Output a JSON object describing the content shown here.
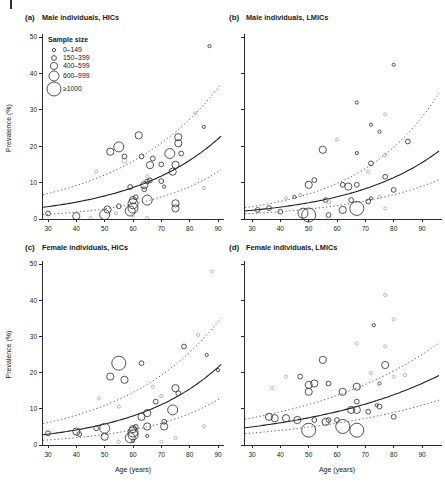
{
  "figure": {
    "type": "four-panel-bubble-scatter",
    "x_axis_label": "Age (years)",
    "y_axis_label": "Prevalence (%)"
  },
  "legend": {
    "title": "Sample size",
    "items": [
      {
        "label": "0–149",
        "size_class": 1
      },
      {
        "label": "150–399",
        "size_class": 2
      },
      {
        "label": "400–599",
        "size_class": 3
      },
      {
        "label": "600–999",
        "size_class": 4
      },
      {
        "label": "≥1000",
        "size_class": 5
      }
    ]
  },
  "style": {
    "point_color": "#3f3f3f",
    "point_color_light": "#b0b0b0",
    "curve_color": "#1e1e1e",
    "ci_color": "#4a4a4a",
    "axis_color": "#2b2b2b",
    "text_color": "#1a1a1a"
  },
  "chart_data": [
    {
      "panel": "a",
      "label": "(a)",
      "title": "Male individuals, HICs",
      "type": "scatter",
      "row": "top",
      "col": "left",
      "xlabel": "Age (years)",
      "ylabel": "Prevalence (%)",
      "xticks": [
        30,
        40,
        50,
        60,
        70,
        80,
        90
      ],
      "yticks": [
        0,
        10,
        20,
        30,
        40,
        50
      ],
      "xlim": [
        28,
        92
      ],
      "ylim": [
        0,
        50
      ],
      "show_legend": true,
      "show_x_title": false,
      "show_y_labels": true,
      "fit_solid": {
        "start": 3.4,
        "end": 22.0
      },
      "fit_upper": {
        "start": 7.0,
        "end": 36.0
      },
      "fit_lower": {
        "start": 1.3,
        "end": 13.0
      },
      "points": [
        [
          30,
          1.5,
          2,
          0
        ],
        [
          40,
          0.8,
          3,
          0
        ],
        [
          45,
          0.3,
          1,
          1
        ],
        [
          50,
          1.2,
          4,
          0
        ],
        [
          51,
          2.6,
          3,
          0
        ],
        [
          54,
          1.6,
          1,
          1
        ],
        [
          55,
          3.5,
          2,
          0
        ],
        [
          47,
          13.0,
          1,
          1
        ],
        [
          52,
          18.5,
          3,
          0
        ],
        [
          55,
          19.8,
          4,
          0
        ],
        [
          57,
          16.0,
          2,
          1
        ],
        [
          57,
          17.2,
          2,
          0
        ],
        [
          59,
          8.8,
          2,
          0
        ],
        [
          59,
          2.2,
          4,
          0
        ],
        [
          60,
          3.0,
          4,
          0
        ],
        [
          60,
          4.2,
          4,
          0
        ],
        [
          60,
          5.2,
          3,
          0
        ],
        [
          61,
          6.0,
          2,
          0
        ],
        [
          60,
          1.0,
          1,
          1
        ],
        [
          62,
          23.0,
          3,
          0
        ],
        [
          63,
          17.2,
          2,
          0
        ],
        [
          64,
          9.3,
          3,
          0
        ],
        [
          64,
          8.2,
          2,
          0
        ],
        [
          65,
          10.3,
          2,
          0
        ],
        [
          66,
          10.6,
          2,
          0
        ],
        [
          65,
          11.7,
          1,
          1
        ],
        [
          65,
          0.3,
          1,
          1
        ],
        [
          65,
          5.2,
          4,
          0
        ],
        [
          66,
          14.8,
          3,
          0
        ],
        [
          67,
          16.6,
          2,
          0
        ],
        [
          70,
          10.4,
          2,
          0
        ],
        [
          71,
          8.9,
          1,
          0
        ],
        [
          70,
          15.0,
          2,
          0
        ],
        [
          73,
          18.0,
          4,
          0
        ],
        [
          75,
          14.9,
          3,
          0
        ],
        [
          74,
          13.0,
          3,
          0
        ],
        [
          76,
          22.5,
          3,
          0
        ],
        [
          76,
          20.8,
          3,
          0
        ],
        [
          75,
          4.3,
          3,
          0
        ],
        [
          75,
          2.9,
          3,
          0
        ],
        [
          77,
          18.0,
          2,
          0
        ],
        [
          82,
          29.0,
          1,
          1
        ],
        [
          85,
          25.3,
          1,
          0
        ],
        [
          85,
          8.5,
          1,
          1
        ],
        [
          87,
          47.5,
          1,
          0
        ]
      ]
    },
    {
      "panel": "b",
      "label": "(b)",
      "title": "Male individuals, LMICs",
      "type": "scatter",
      "row": "top",
      "col": "right",
      "xlabel": "Age (years)",
      "ylabel": "Prevalence (%)",
      "xticks": [
        30,
        40,
        50,
        60,
        70,
        80,
        90
      ],
      "yticks": [
        0,
        10,
        20,
        30,
        40,
        50
      ],
      "xlim": [
        28,
        92
      ],
      "ylim": [
        0,
        50
      ],
      "show_legend": false,
      "show_x_title": false,
      "show_y_labels": false,
      "fit_solid": {
        "start": 2.4,
        "end": 15.5
      },
      "fit_upper": {
        "start": 3.4,
        "end": 28.0
      },
      "fit_lower": {
        "start": 1.5,
        "end": 9.0
      },
      "points": [
        [
          32,
          2.5,
          2,
          0
        ],
        [
          36,
          3.0,
          2,
          0
        ],
        [
          40,
          2.0,
          2,
          0
        ],
        [
          42,
          5.7,
          1,
          1
        ],
        [
          45,
          6.1,
          1,
          0
        ],
        [
          47,
          6.6,
          1,
          1
        ],
        [
          48,
          1.6,
          4,
          0
        ],
        [
          50,
          1.1,
          5,
          0
        ],
        [
          50,
          9.4,
          3,
          0
        ],
        [
          52,
          10.7,
          2,
          0
        ],
        [
          55,
          19.0,
          3,
          0
        ],
        [
          56,
          5.2,
          2,
          0
        ],
        [
          57,
          4.8,
          2,
          1
        ],
        [
          57,
          1.1,
          2,
          0
        ],
        [
          60,
          21.8,
          1,
          1
        ],
        [
          62,
          9.4,
          2,
          0
        ],
        [
          62,
          2.5,
          3,
          0
        ],
        [
          64,
          8.9,
          3,
          0
        ],
        [
          65,
          5.2,
          2,
          0
        ],
        [
          67,
          18.1,
          1,
          0
        ],
        [
          67,
          9.4,
          2,
          0
        ],
        [
          67,
          2.9,
          5,
          0
        ],
        [
          67,
          32.0,
          1,
          0
        ],
        [
          71,
          13.0,
          1,
          1
        ],
        [
          72,
          25.9,
          1,
          0
        ],
        [
          72,
          15.3,
          2,
          0
        ],
        [
          71,
          4.8,
          2,
          0
        ],
        [
          72,
          5.7,
          1,
          0
        ],
        [
          75,
          24.0,
          1,
          0
        ],
        [
          75,
          6.1,
          1,
          1
        ],
        [
          77,
          28.7,
          1,
          1
        ],
        [
          77,
          17.6,
          1,
          1
        ],
        [
          77,
          11.6,
          2,
          0
        ],
        [
          77,
          2.9,
          1,
          1
        ],
        [
          80,
          42.4,
          1,
          0
        ],
        [
          80,
          8.0,
          2,
          0
        ],
        [
          85,
          21.3,
          2,
          0
        ]
      ]
    },
    {
      "panel": "c",
      "label": "(c)",
      "title": "Female individuals, HICs",
      "type": "scatter",
      "row": "bottom",
      "col": "left",
      "xlabel": "Age (years)",
      "ylabel": "Prevalence (%)",
      "xticks": [
        30,
        40,
        50,
        60,
        70,
        80,
        90
      ],
      "yticks": [
        0,
        10,
        20,
        30,
        40,
        50
      ],
      "xlim": [
        28,
        92
      ],
      "ylim": [
        0,
        50
      ],
      "show_legend": false,
      "show_x_title": true,
      "show_y_labels": true,
      "fit_solid": {
        "start": 3.0,
        "end": 21.5
      },
      "fit_upper": {
        "start": 6.2,
        "end": 34.0
      },
      "fit_lower": {
        "start": 1.4,
        "end": 12.5
      },
      "points": [
        [
          30,
          3.2,
          2,
          0
        ],
        [
          40,
          3.7,
          3,
          0
        ],
        [
          41,
          3.0,
          2,
          0
        ],
        [
          47,
          4.6,
          2,
          0
        ],
        [
          48,
          12.9,
          1,
          1
        ],
        [
          50,
          4.6,
          4,
          0
        ],
        [
          50,
          2.3,
          3,
          0
        ],
        [
          52,
          18.9,
          3,
          0
        ],
        [
          55,
          22.6,
          5,
          0
        ],
        [
          55,
          10.6,
          1,
          1
        ],
        [
          57,
          18.0,
          3,
          0
        ],
        [
          55,
          0.9,
          1,
          1
        ],
        [
          59,
          2.0,
          4,
          0
        ],
        [
          60,
          2.8,
          4,
          0
        ],
        [
          60,
          3.6,
          4,
          0
        ],
        [
          60,
          4.4,
          3,
          0
        ],
        [
          60,
          1.2,
          1,
          0
        ],
        [
          61,
          5.0,
          2,
          0
        ],
        [
          63,
          22.6,
          2,
          0
        ],
        [
          63,
          7.8,
          3,
          0
        ],
        [
          65,
          5.1,
          3,
          0
        ],
        [
          65,
          2.5,
          1,
          0
        ],
        [
          65,
          8.8,
          3,
          0
        ],
        [
          67,
          16.1,
          1,
          1
        ],
        [
          68,
          12.0,
          2,
          0
        ],
        [
          70,
          13.5,
          1,
          1
        ],
        [
          71,
          6.4,
          2,
          0
        ],
        [
          71,
          5.1,
          3,
          0
        ],
        [
          70,
          0.9,
          1,
          1
        ],
        [
          74,
          9.7,
          4,
          0
        ],
        [
          75,
          15.7,
          3,
          0
        ],
        [
          76,
          14.3,
          2,
          0
        ],
        [
          75,
          1.9,
          1,
          1
        ],
        [
          78,
          27.2,
          2,
          0
        ],
        [
          83,
          30.4,
          1,
          1
        ],
        [
          85,
          5.2,
          1,
          1
        ],
        [
          86,
          24.9,
          1,
          0
        ],
        [
          88,
          47.9,
          1,
          1
        ],
        [
          90,
          20.7,
          1,
          0
        ]
      ]
    },
    {
      "panel": "d",
      "label": "(d)",
      "title": "Female individuals, LMICs",
      "type": "scatter",
      "row": "bottom",
      "col": "right",
      "xlabel": "Age (years)",
      "ylabel": "Prevalence (%)",
      "xticks": [
        30,
        40,
        50,
        60,
        70,
        80,
        90
      ],
      "yticks": [
        0,
        10,
        20,
        30,
        40,
        50
      ],
      "xlim": [
        28,
        92
      ],
      "ylim": [
        0,
        50
      ],
      "show_legend": false,
      "show_x_title": true,
      "show_y_labels": false,
      "fit_solid": {
        "start": 5.0,
        "end": 17.0
      },
      "fit_upper": {
        "start": 7.5,
        "end": 25.0
      },
      "fit_lower": {
        "start": 3.3,
        "end": 11.0
      },
      "points": [
        [
          36,
          7.8,
          3,
          0
        ],
        [
          37,
          15.7,
          1,
          1
        ],
        [
          38,
          7.4,
          3,
          0
        ],
        [
          42,
          7.4,
          3,
          0
        ],
        [
          42,
          18.9,
          1,
          1
        ],
        [
          46,
          6.9,
          3,
          0
        ],
        [
          47,
          18.9,
          2,
          0
        ],
        [
          50,
          16.6,
          3,
          0
        ],
        [
          52,
          17.0,
          3,
          0
        ],
        [
          50,
          14.7,
          3,
          0
        ],
        [
          50,
          4.1,
          5,
          0
        ],
        [
          52,
          6.9,
          2,
          0
        ],
        [
          55,
          23.5,
          3,
          0
        ],
        [
          57,
          17.0,
          2,
          0
        ],
        [
          56,
          6.4,
          3,
          0
        ],
        [
          57,
          6.9,
          2,
          0
        ],
        [
          60,
          6.9,
          2,
          0
        ],
        [
          62,
          14.7,
          3,
          0
        ],
        [
          62,
          5.1,
          5,
          0
        ],
        [
          65,
          9.7,
          3,
          0
        ],
        [
          67,
          16.1,
          3,
          0
        ],
        [
          67,
          12.0,
          2,
          0
        ],
        [
          67,
          9.7,
          3,
          0
        ],
        [
          67,
          4.1,
          5,
          0
        ],
        [
          67,
          28.0,
          1,
          1
        ],
        [
          71,
          9.2,
          2,
          0
        ],
        [
          72,
          19.8,
          1,
          1
        ],
        [
          73,
          33.1,
          1,
          0
        ],
        [
          74,
          11.0,
          1,
          0
        ],
        [
          75,
          17.0,
          1,
          0
        ],
        [
          75,
          10.6,
          2,
          0
        ],
        [
          77,
          41.4,
          1,
          1
        ],
        [
          77,
          27.2,
          1,
          1
        ],
        [
          77,
          22.1,
          3,
          0
        ],
        [
          80,
          34.7,
          1,
          1
        ],
        [
          80,
          18.9,
          1,
          1
        ],
        [
          80,
          7.8,
          2,
          0
        ],
        [
          84,
          19.3,
          1,
          1
        ]
      ]
    }
  ]
}
